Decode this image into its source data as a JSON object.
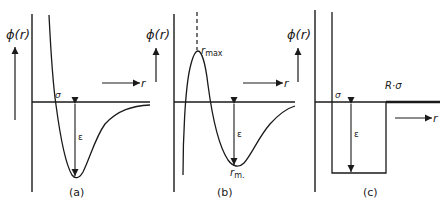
{
  "figure": {
    "panels": [
      {
        "id": "a",
        "caption": "(a)",
        "y_axis_label": "ϕ(r)",
        "x_axis_label": "r",
        "sigma_label": "σ",
        "epsilon_label": "ε",
        "curve": "Lennard-Jones type potential well"
      },
      {
        "id": "b",
        "caption": "(b)",
        "y_axis_label": "ϕ(r)",
        "x_axis_label": "r",
        "rmax_label": "r",
        "rmax_sub": "max",
        "rmin_label": "r",
        "rmin_sub": "m.",
        "epsilon_label": "ε",
        "curve": "potential with repulsive hump at r_max and well at r_m"
      },
      {
        "id": "c",
        "caption": "(c)",
        "y_axis_label": "ϕ(r)",
        "x_axis_label": "r",
        "sigma_label": "σ",
        "r_sigma_label": "R·σ",
        "epsilon_label": "ε",
        "curve": "square well potential"
      }
    ]
  },
  "colors": {
    "ink": "#1a1a1a",
    "background": "#ffffff"
  }
}
